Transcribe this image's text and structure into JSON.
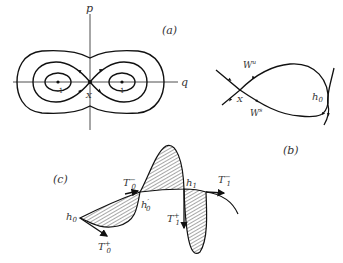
{
  "panels": {
    "a": {
      "label": "(a)",
      "axis_x": "q",
      "axis_y": "p",
      "point_left": "−1",
      "point_right": "1",
      "saddle": "X"
    },
    "b": {
      "label": "(b)",
      "unstable_manifold": "W",
      "unstable_sup": "u",
      "stable_manifold": "W",
      "stable_sup": "s",
      "saddle": "X",
      "homoclinic_point": "h",
      "homoclinic_sub": "0"
    },
    "c": {
      "label": "(c)",
      "h0": "h",
      "h0_sub": "0",
      "h0prime": "h",
      "h0prime_sub": "0",
      "h0prime_sup": "′",
      "h1": "h",
      "h1_sub": "1",
      "T0minus": "T",
      "T0minus_sub": "0",
      "T0minus_sup": "−",
      "T0plus": "T",
      "T0plus_sub": "0",
      "T0plus_sup": "+",
      "T1minus": "T",
      "T1minus_sub": "1",
      "T1minus_sup": "−",
      "T1plus": "T",
      "T1plus_sub": "1",
      "T1plus_sup": "+"
    }
  },
  "colors": {
    "stroke": "#1a1a1a",
    "text": "#333333",
    "background": "#ffffff"
  }
}
